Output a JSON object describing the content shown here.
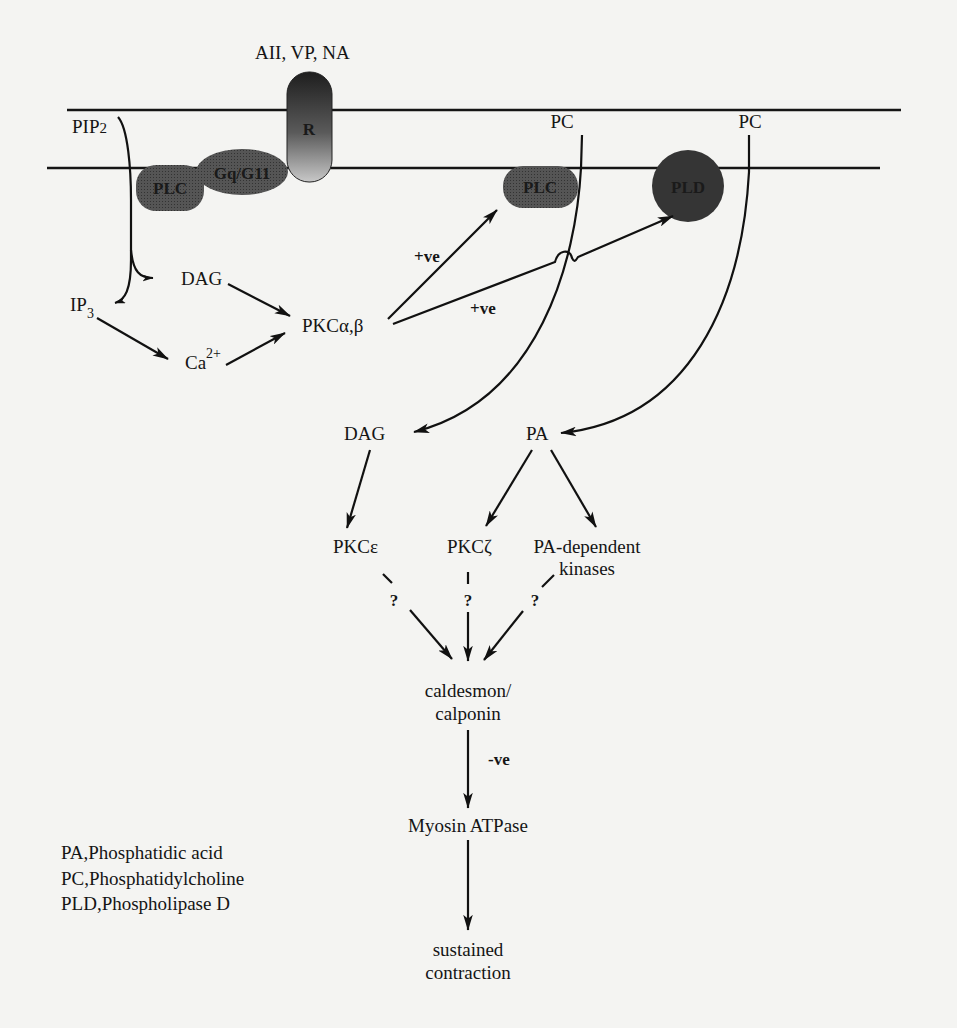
{
  "figure": {
    "agonists": "AII, VP, NA",
    "receptor": "R",
    "g_protein": "Gq/G11",
    "substrate_left": "PIP",
    "substrate_left_sub": "2",
    "plc_left": "PLC",
    "plc_right": "PLC",
    "pld": "PLD",
    "pc_left": "PC",
    "pc_right": "PC",
    "dag_top": "DAG",
    "ip3": "IP",
    "ip3_sub": "3",
    "calcium": "Ca",
    "calcium_sup": "2+",
    "pkc_ab": "PKCα,β",
    "plus_ve_1": "+ve",
    "plus_ve_2": "+ve",
    "dag_bottom": "DAG",
    "pa": "PA",
    "pkc_epsilon": "PKCε",
    "pkc_zeta": "PKCζ",
    "pa_kinases_line1": "PA-dependent",
    "pa_kinases_line2": "kinases",
    "question_1": "?",
    "question_2": "?",
    "question_3": "?",
    "caldesmon_line1": "caldesmon/",
    "caldesmon_line2": "calponin",
    "minus_ve": "-ve",
    "myosin": "Myosin ATPase",
    "outcome_line1": "sustained",
    "outcome_line2": "contraction"
  },
  "legend": [
    "PA,Phosphatidic acid",
    "PC,Phosphatidylcholine",
    "PLD,Phospholipase D"
  ],
  "colors": {
    "background": "#f4f4f2",
    "enzyme_fill": "#4a4a4a",
    "pld_fill": "#2e2e2e",
    "ink": "#111111"
  }
}
